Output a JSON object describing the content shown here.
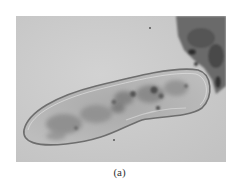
{
  "figure": {
    "caption": "(a)",
    "colors": {
      "background": "#c9c9c9",
      "cell_fill": "#b5b5b5",
      "cell_membrane": "#6e6e6e",
      "debris": "#5a5a5a",
      "caption_text": "#333333"
    }
  }
}
